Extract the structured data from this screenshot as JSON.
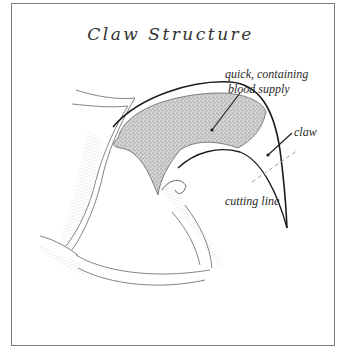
{
  "diagram": {
    "title": "Claw Structure",
    "labels": {
      "quick_line1": "quick, containing",
      "quick_line2": "blood supply",
      "claw": "claw",
      "cutting_line": "cutting line"
    },
    "colors": {
      "border": "#7a7a7a",
      "ink": "#1a1a1a",
      "stipple": "#9a9a9a",
      "hatch": "#b5b5b5",
      "cut_line": "#9c9c9c"
    }
  }
}
